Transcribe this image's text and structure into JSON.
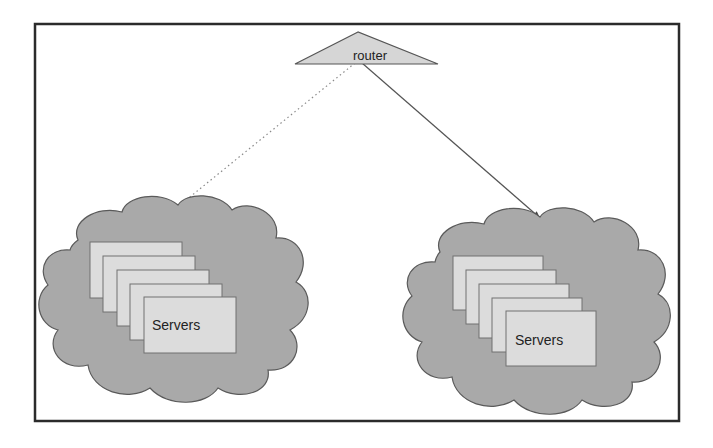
{
  "diagram": {
    "router": {
      "label": "router"
    },
    "clouds": [
      {
        "id": "left",
        "servers_label": "Servers",
        "server_count": 5,
        "link_style": "dotted"
      },
      {
        "id": "right",
        "servers_label": "Servers",
        "server_count": 5,
        "link_style": "solid-arrow"
      }
    ],
    "colors": {
      "frame": "#2b2b2b",
      "router_fill": "#d6d6d6",
      "router_stroke": "#555555",
      "cloud_fill": "#a9a9a9",
      "cloud_stroke": "#5a5a5a",
      "server_fill": "#dcdcdc",
      "server_stroke": "#707070"
    }
  }
}
